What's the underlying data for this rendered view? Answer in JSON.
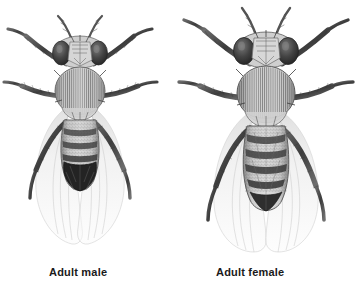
{
  "figure": {
    "background_color": "#ffffff",
    "width": 358,
    "height": 307
  },
  "captions": {
    "male": "Adult male",
    "female": "Adult female"
  },
  "specimens": [
    {
      "id": "male",
      "label": "Adult male",
      "sex": "male",
      "relative_size": "smaller",
      "body_length_px": 150,
      "body_width_px": 52,
      "abdomen": {
        "tip": "rounded",
        "tip_shading": "solid dark",
        "segment_bands": 3,
        "description": "Abdomen with a few dorsal bands fusing into a solid dark rounded posterior tip"
      },
      "thorax": {
        "striations": 26,
        "shape": "oval, finely longitudinally striated"
      },
      "head": {
        "eyes": 2,
        "eye_color": "#3a3a3a",
        "antennae": 2
      },
      "wings": {
        "count": 2,
        "appearance": "translucent pale, extending well beyond abdomen tip"
      },
      "legs": {
        "count": 6,
        "appearance": "dark, bristled, segmented"
      }
    },
    {
      "id": "female",
      "label": "Adult female",
      "sex": "female",
      "relative_size": "larger",
      "body_length_px": 175,
      "body_width_px": 62,
      "abdomen": {
        "tip": "pointed",
        "tip_shading": "banded",
        "segment_bands": 5,
        "description": "Larger abdomen with five distinct dark transverse bands tapering to a pointed tip"
      },
      "thorax": {
        "striations": 30,
        "shape": "broad oval, finely longitudinally striated"
      },
      "head": {
        "eyes": 2,
        "eye_color": "#3a3a3a",
        "antennae": 2
      },
      "wings": {
        "count": 2,
        "appearance": "translucent pale, extending well beyond abdomen tip"
      },
      "legs": {
        "count": 6,
        "appearance": "dark, bristled, segmented"
      }
    }
  ],
  "colors": {
    "ink_dark": "#2b2b2b",
    "ink_mid": "#6e6e6e",
    "ink_light": "#b8b8b8",
    "wing_fill": "#f4f4f4",
    "body_fill": "#cfcfcf",
    "caption_text": "#1a1a1a"
  }
}
